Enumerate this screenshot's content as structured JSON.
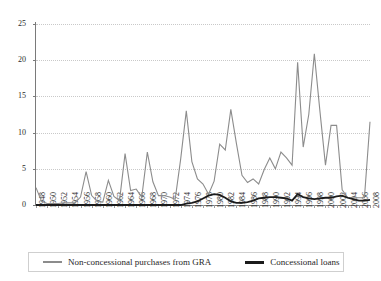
{
  "chart_data": {
    "type": "line",
    "title": "",
    "xlabel": "",
    "ylabel": "",
    "ylim": [
      0,
      25
    ],
    "xlim": [
      1948,
      2008
    ],
    "yticks": [
      0,
      5,
      10,
      15,
      20,
      25
    ],
    "grid": true,
    "legend_position": "bottom",
    "xticks": [
      1948,
      1950,
      1952,
      1954,
      1956,
      1958,
      1960,
      1962,
      1964,
      1966,
      1968,
      1970,
      1972,
      1974,
      1976,
      1978,
      1980,
      1982,
      1984,
      1986,
      1988,
      1990,
      1992,
      1994,
      1996,
      1998,
      2000,
      2002,
      2004,
      2006,
      2008
    ],
    "x": [
      1948,
      1949,
      1950,
      1951,
      1952,
      1953,
      1954,
      1955,
      1956,
      1957,
      1958,
      1959,
      1960,
      1961,
      1962,
      1963,
      1964,
      1965,
      1966,
      1967,
      1968,
      1969,
      1970,
      1971,
      1972,
      1973,
      1974,
      1975,
      1976,
      1977,
      1978,
      1979,
      1980,
      1981,
      1982,
      1983,
      1984,
      1985,
      1986,
      1987,
      1988,
      1989,
      1990,
      1991,
      1992,
      1993,
      1994,
      1995,
      1996,
      1997,
      1998,
      1999,
      2000,
      2001,
      2002,
      2003,
      2004,
      2005,
      2006,
      2007,
      2008
    ],
    "series": [
      {
        "name": "Non-concessional purchases from GRA",
        "color": "#8c8c8c",
        "values": [
          2.4,
          0.5,
          0.2,
          0.2,
          0.2,
          0.3,
          0.3,
          0.3,
          1.1,
          4.6,
          1.3,
          0.5,
          0.4,
          3.4,
          1.2,
          0.6,
          7.1,
          2.0,
          2.2,
          1.1,
          7.3,
          3.2,
          1.3,
          1.3,
          1.1,
          0.8,
          6.4,
          13.0,
          6.0,
          3.6,
          2.9,
          1.5,
          3.3,
          8.4,
          7.6,
          13.2,
          8.5,
          4.1,
          3.1,
          3.6,
          2.9,
          4.9,
          6.5,
          5.0,
          7.3,
          6.5,
          5.5,
          19.7,
          8.0,
          12.5,
          20.9,
          13.0,
          5.5,
          11.0,
          11.0,
          2.1,
          1.0,
          1.0,
          1.0,
          1.0,
          11.5
        ],
        "linewidth": 1.1
      },
      {
        "name": "Concessional loans",
        "color": "#1b1b1b",
        "values": [
          0,
          0,
          0,
          0,
          0,
          0,
          0,
          0,
          0,
          0,
          0,
          0,
          0,
          0,
          0,
          0,
          0,
          0,
          0,
          0,
          0,
          0,
          0,
          0,
          0,
          0,
          0,
          0.2,
          0.3,
          0.5,
          0.9,
          1.3,
          1.5,
          1.4,
          1.0,
          0.5,
          0.3,
          0.3,
          0.4,
          0.6,
          0.9,
          1.0,
          1.1,
          1.1,
          1.0,
          0.9,
          0.6,
          1.5,
          1.1,
          0.9,
          0.8,
          0.9,
          1.0,
          1.0,
          1.2,
          1.3,
          1.0,
          0.8,
          0.6,
          0.6,
          0.7
        ],
        "linewidth": 1.8
      }
    ]
  },
  "legend": {
    "items": [
      {
        "label": "Non-concessional purchases from GRA",
        "color": "#8c8c8c"
      },
      {
        "label": "Concessional loans",
        "color": "#1b1b1b"
      }
    ]
  }
}
